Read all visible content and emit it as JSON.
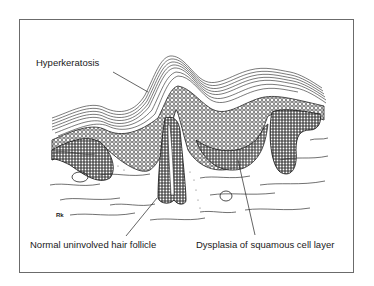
{
  "figure": {
    "labels": {
      "hyperkeratosis": "Hyperkeratosis",
      "hair_follicle": "Normal uninvolved hair follicle",
      "dysplasia": "Dysplasia of squamous cell layer"
    },
    "signature": "Rk",
    "colors": {
      "ink": "#1a1a1a",
      "frame": "#6b6b6b",
      "background": "#ffffff"
    }
  }
}
